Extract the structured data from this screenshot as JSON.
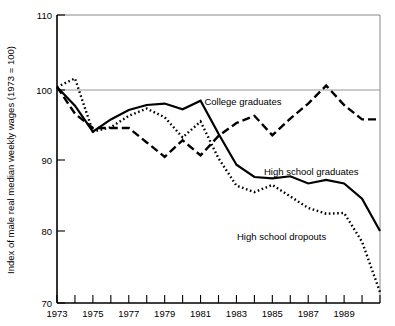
{
  "chart_data": {
    "type": "line",
    "title": "",
    "subtitle": "",
    "xlabel": "",
    "ylabel": "Index of male real median weekly wages (1973 = 100)",
    "xlim": [
      1973,
      1991
    ],
    "ylim": [
      70,
      110
    ],
    "y_ticks": [
      70,
      80,
      90,
      100,
      110
    ],
    "y_tick_labels": [
      "70",
      "80",
      "90",
      "100",
      "110"
    ],
    "x_ticks": [
      1973,
      1974,
      1975,
      1976,
      1977,
      1978,
      1979,
      1980,
      1981,
      1982,
      1983,
      1984,
      1985,
      1986,
      1987,
      1988,
      1989,
      1990,
      1991
    ],
    "x_tick_labels": [
      "1973",
      "",
      "1975",
      "",
      "1977",
      "",
      "1979",
      "",
      "1981",
      "",
      "1983",
      "",
      "1985",
      "",
      "1987",
      "",
      "1989",
      "",
      ""
    ],
    "x_tick_labels_shown": [
      "1973",
      "1975",
      "1977",
      "1979",
      "1981",
      "1983",
      "1985",
      "1987",
      "1989"
    ],
    "grid": false,
    "reference_line_y": 100,
    "legend_position": "inline-annotations",
    "x": [
      1973,
      1974,
      1975,
      1976,
      1977,
      1978,
      1979,
      1980,
      1981,
      1982,
      1983,
      1984,
      1985,
      1986,
      1987,
      1988,
      1989,
      1990,
      1991
    ],
    "series": [
      {
        "name": "College graduates",
        "style": "dashed",
        "label": "College graduates",
        "values": [
          100.0,
          96.3,
          94.3,
          94.3,
          94.3,
          92.3,
          90.3,
          92.6,
          90.5,
          93.2,
          95.0,
          96.0,
          93.3,
          95.6,
          97.7,
          100.2,
          97.5,
          95.5,
          95.5
        ]
      },
      {
        "name": "High school graduates",
        "style": "solid",
        "label": "High school graduates",
        "values": [
          100.0,
          97.4,
          93.8,
          95.5,
          96.8,
          97.5,
          97.7,
          96.9,
          98.1,
          93.5,
          89.2,
          87.5,
          87.3,
          87.6,
          86.6,
          87.1,
          86.6,
          84.5,
          80.0
        ]
      },
      {
        "name": "High school dropouts",
        "style": "dotted",
        "label": "High school dropouts",
        "values": [
          100.0,
          101.2,
          93.8,
          94.4,
          96.0,
          97.0,
          95.8,
          93.0,
          95.2,
          90.1,
          86.3,
          85.4,
          86.4,
          84.8,
          83.2,
          82.4,
          82.5,
          78.5,
          71.5
        ]
      }
    ],
    "annotations": [
      {
        "text": "College graduates",
        "x_px": 243,
        "y_px": 105
      },
      {
        "text": "High school graduates",
        "x_px": 264,
        "y_px": 175
      },
      {
        "text": "High school dropouts",
        "x_px": 237,
        "y_px": 240
      }
    ]
  }
}
